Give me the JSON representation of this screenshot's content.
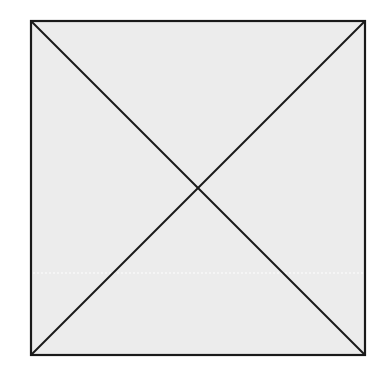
{
  "diagram": {
    "type": "square-with-diagonals",
    "canvas": {
      "width": 388,
      "height": 383,
      "background": "#ffffff"
    },
    "square": {
      "x": 31,
      "y": 21,
      "width": 334,
      "height": 334,
      "fill": "#ececec",
      "stroke": "#1a1a1a",
      "stroke_width": 2.2
    },
    "diagonals": [
      {
        "x1": 31,
        "y1": 21,
        "x2": 365,
        "y2": 355
      },
      {
        "x1": 365,
        "y1": 21,
        "x2": 31,
        "y2": 355
      }
    ],
    "diagonal_color": "#1a1a1a",
    "diagonal_width": 2,
    "faint_line": {
      "y": 273,
      "x1": 33,
      "x2": 363,
      "color": "#f8f8f8"
    }
  }
}
